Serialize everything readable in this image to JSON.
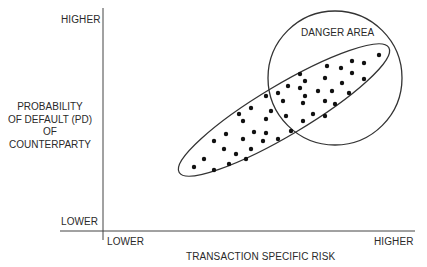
{
  "diagram": {
    "type": "risk-scatter-concept",
    "y_axis": {
      "title_lines": [
        "PROBABILITY",
        "OF DEFAULT (PD)",
        "OF",
        "COUNTERPARTY"
      ],
      "high_label": "HIGHER",
      "low_label": "LOWER"
    },
    "x_axis": {
      "title": "TRANSACTION SPECIFIC RISK",
      "low_label": "LOWER",
      "high_label": "HIGHER"
    },
    "danger_zone": {
      "label": "DANGER AREA",
      "shape": "circle",
      "center": [
        335,
        78
      ],
      "radius": 67
    },
    "cluster_ellipse": {
      "center": [
        284,
        110
      ],
      "rx": 122,
      "ry": 25,
      "rotation_deg": -30.8
    },
    "points": [
      [
        194,
        167
      ],
      [
        204,
        159
      ],
      [
        214,
        170
      ],
      [
        214,
        141
      ],
      [
        224,
        149
      ],
      [
        226,
        134
      ],
      [
        229,
        164
      ],
      [
        236,
        154
      ],
      [
        239,
        114
      ],
      [
        243,
        121
      ],
      [
        243,
        139
      ],
      [
        246,
        159
      ],
      [
        251,
        108
      ],
      [
        254,
        132
      ],
      [
        251,
        149
      ],
      [
        263,
        141
      ],
      [
        266,
        133
      ],
      [
        266,
        119
      ],
      [
        266,
        96
      ],
      [
        271,
        111
      ],
      [
        278,
        93
      ],
      [
        278,
        139
      ],
      [
        283,
        101
      ],
      [
        286,
        116
      ],
      [
        288,
        86
      ],
      [
        291,
        131
      ],
      [
        300,
        88
      ],
      [
        303,
        103
      ],
      [
        303,
        121
      ],
      [
        305,
        96
      ],
      [
        305,
        81
      ],
      [
        313,
        114
      ],
      [
        318,
        91
      ],
      [
        325,
        101
      ],
      [
        325,
        116
      ],
      [
        300,
        74
      ],
      [
        325,
        78
      ],
      [
        327,
        66
      ],
      [
        332,
        91
      ],
      [
        335,
        104
      ],
      [
        341,
        68
      ],
      [
        342,
        83
      ],
      [
        349,
        93
      ],
      [
        352,
        61
      ],
      [
        352,
        73
      ],
      [
        364,
        63
      ],
      [
        364,
        79
      ],
      [
        379,
        55
      ]
    ],
    "colors": {
      "line": "#333333",
      "point": "#111111",
      "text": "#2a2a2a"
    }
  }
}
